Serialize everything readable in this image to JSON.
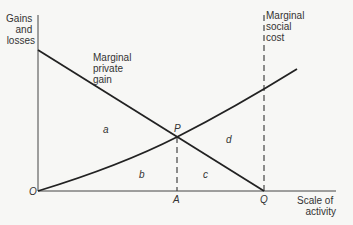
{
  "diagram": {
    "y_axis_label": [
      "Gains",
      "and",
      "losses"
    ],
    "x_axis_label": [
      "Scale of",
      "activity"
    ],
    "origin_label": "O",
    "curves": {
      "marginal_private_gain": {
        "label": [
          "Marginal",
          "private",
          "gain"
        ]
      },
      "marginal_social_cost": {
        "label": [
          "Marginal",
          "social",
          "cost"
        ]
      }
    },
    "points": {
      "intersection": "P",
      "optimum_x": "A",
      "private_max_x": "Q"
    },
    "areas": [
      "a",
      "b",
      "c",
      "d"
    ],
    "colors": {
      "line": "#222222",
      "text": "#333333",
      "background": "#f7f7f5"
    }
  }
}
